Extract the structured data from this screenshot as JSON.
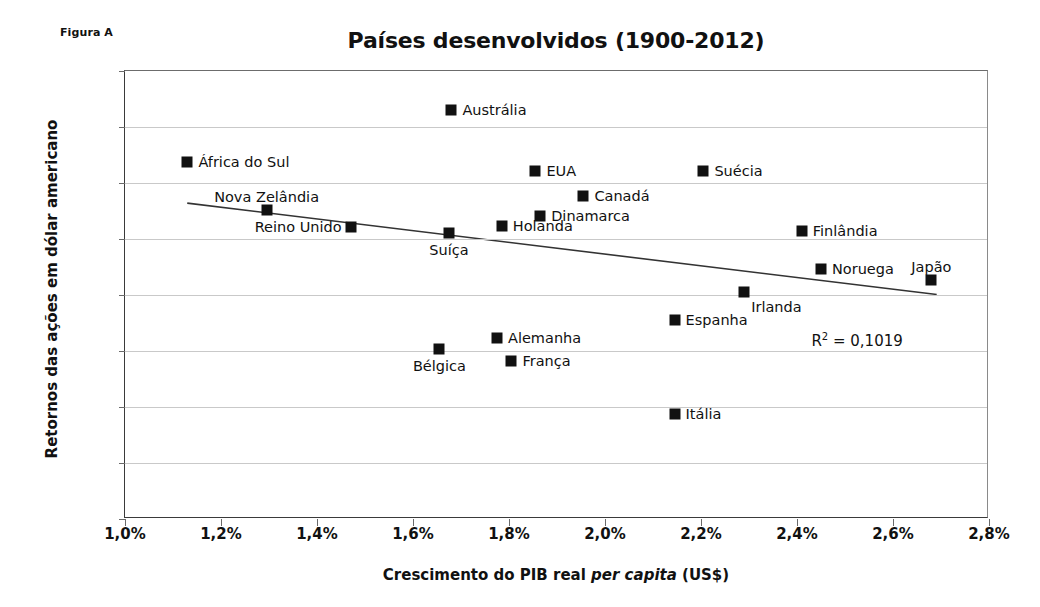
{
  "figure_caption": "Figura A",
  "chart_data": {
    "type": "scatter",
    "title": "Países desenvolvidos (1900-2012)",
    "xlabel_prefix": "Crescimento do PIB real ",
    "xlabel_italic": "per capita",
    "xlabel_suffix": " (US$)",
    "ylabel": "Retornos das ações em dólar americano",
    "xlim": [
      1.0,
      2.8
    ],
    "ylim": [
      0,
      8
    ],
    "xticks": [
      "1,0%",
      "1,2%",
      "1,4%",
      "1,6%",
      "1,8%",
      "2,0%",
      "2,2%",
      "2,4%",
      "2,6%",
      "2,8%"
    ],
    "xtick_values": [
      1.0,
      1.2,
      1.4,
      1.6,
      1.8,
      2.0,
      2.2,
      2.4,
      2.6,
      2.8
    ],
    "yticks": [
      "0%",
      "1%",
      "2%",
      "3%",
      "4%",
      "5%",
      "6%",
      "7%",
      "8%"
    ],
    "ytick_values": [
      0,
      1,
      2,
      3,
      4,
      5,
      6,
      7,
      8
    ],
    "grid": "horizontal",
    "legend": "none",
    "marker_color": "#111111",
    "points": [
      {
        "label": "Austrália",
        "x": 1.68,
        "y": 7.3,
        "label_pos": "right"
      },
      {
        "label": "África do Sul",
        "x": 1.13,
        "y": 6.37,
        "label_pos": "right"
      },
      {
        "label": "EUA",
        "x": 1.855,
        "y": 6.22,
        "label_pos": "right"
      },
      {
        "label": "Suécia",
        "x": 2.205,
        "y": 6.22,
        "label_pos": "right"
      },
      {
        "label": "Canadá",
        "x": 1.955,
        "y": 5.77,
        "label_pos": "right"
      },
      {
        "label": "Dinamarca",
        "x": 1.865,
        "y": 5.41,
        "label_pos": "right"
      },
      {
        "label": "Nova Zelândia",
        "x": 1.295,
        "y": 5.51,
        "label_pos": "above"
      },
      {
        "label": "Holanda",
        "x": 1.785,
        "y": 5.23,
        "label_pos": "right"
      },
      {
        "label": "Finlândia",
        "x": 2.41,
        "y": 5.14,
        "label_pos": "right"
      },
      {
        "label": "Reino Unido",
        "x": 1.47,
        "y": 5.21,
        "label_pos": "left"
      },
      {
        "label": "Suíça",
        "x": 1.675,
        "y": 5.11,
        "label_pos": "below"
      },
      {
        "label": "Noruega",
        "x": 2.45,
        "y": 4.46,
        "label_pos": "right"
      },
      {
        "label": "Japão",
        "x": 2.68,
        "y": 4.27,
        "label_pos": "above"
      },
      {
        "label": "Irlanda",
        "x": 2.29,
        "y": 4.06,
        "label_pos": "below-right"
      },
      {
        "label": "Espanha",
        "x": 2.145,
        "y": 3.55,
        "label_pos": "right"
      },
      {
        "label": "Alemanha",
        "x": 1.775,
        "y": 3.23,
        "label_pos": "right"
      },
      {
        "label": "Bélgica",
        "x": 1.655,
        "y": 3.04,
        "label_pos": "below"
      },
      {
        "label": "França",
        "x": 1.805,
        "y": 2.83,
        "label_pos": "right"
      },
      {
        "label": "Itália",
        "x": 2.145,
        "y": 1.87,
        "label_pos": "right"
      }
    ],
    "trendline": {
      "x0": 1.13,
      "y0": 5.63,
      "x1": 2.695,
      "y1": 3.99,
      "color": "#333333"
    },
    "annotation": {
      "r2_prefix": "R",
      "r2_sup": "2",
      "r2_value": " = 0,1019",
      "x": 2.43,
      "y": 3.35
    }
  }
}
